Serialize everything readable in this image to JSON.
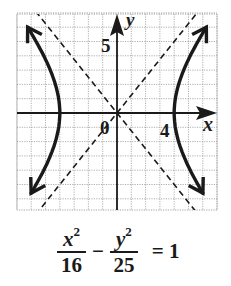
{
  "chart_data": {
    "type": "line",
    "title": "",
    "equation": "x^2/16 - y^2/25 = 1",
    "xlabel": "x",
    "ylabel": "y",
    "xlim": [
      -7,
      7
    ],
    "ylim": [
      -6.8,
      7
    ],
    "grid": true,
    "grid_step": 1,
    "tick_labels": [
      {
        "axis": "x",
        "value": 4,
        "text": "4"
      },
      {
        "axis": "y",
        "value": 5,
        "text": "5"
      },
      {
        "axis": "origin",
        "value": 0,
        "text": "0"
      }
    ],
    "series": [
      {
        "name": "hyperbola-right-branch",
        "style": "solid",
        "a": 4,
        "b": 5,
        "vertex": [
          4,
          0
        ]
      },
      {
        "name": "hyperbola-left-branch",
        "style": "solid",
        "a": 4,
        "b": 5,
        "vertex": [
          -4,
          0
        ]
      },
      {
        "name": "asymptote-positive",
        "style": "dashed",
        "equation": "y = (5/4)x"
      },
      {
        "name": "asymptote-negative",
        "style": "dashed",
        "equation": "y = -(5/4)x"
      }
    ]
  },
  "labels": {
    "x_axis": "x",
    "y_axis": "y",
    "origin": "0",
    "x_tick": "4",
    "y_tick": "5"
  },
  "equation": {
    "num1_var": "x",
    "num1_exp": "2",
    "den1": "16",
    "minus": "−",
    "num2_var": "y",
    "num2_exp": "2",
    "den2": "25",
    "equals": "= 1"
  },
  "colors": {
    "ink": "#1a1a1a",
    "grid": "#9a9a9a",
    "background": "#ffffff"
  }
}
